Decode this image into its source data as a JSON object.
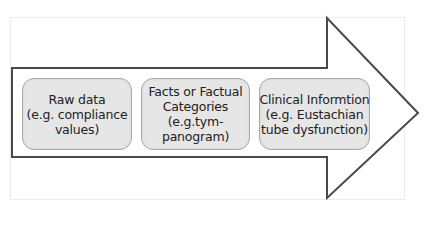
{
  "diagram": {
    "type": "process-arrow",
    "colors": {
      "arrow_stroke": "#4a4a4a",
      "box_fill": "#e6e6e6",
      "box_border": "#a9a9a9",
      "text": "#222222"
    },
    "steps": [
      {
        "lines": [
          "Raw data",
          "(e.g. compliance",
          "values)"
        ]
      },
      {
        "lines": [
          "Facts or Factual",
          "Categories",
          "(e.g.tym-",
          "panogram)"
        ]
      },
      {
        "lines": [
          "Clinical Informtion",
          "(e.g. Eustachian",
          "tube dysfunction)"
        ]
      }
    ]
  }
}
